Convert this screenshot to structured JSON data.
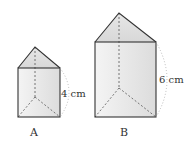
{
  "prisms": [
    {
      "name": "A",
      "height_label": "4 cm"
    },
    {
      "name": "B",
      "height_label": "6 cm"
    }
  ],
  "colors": {
    "stroke": "#333333",
    "face_light": "#f0f0f0",
    "face_mid": "#e2e2e2",
    "dotted": "#aaaaaa"
  }
}
